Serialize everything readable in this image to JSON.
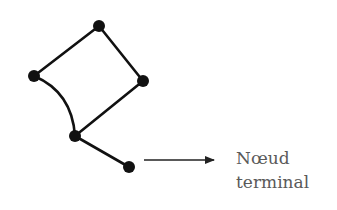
{
  "diagram": {
    "type": "graph",
    "nodes": [
      {
        "id": "top",
        "x": 99,
        "y": 26
      },
      {
        "id": "left",
        "x": 34,
        "y": 76
      },
      {
        "id": "right",
        "x": 143,
        "y": 81
      },
      {
        "id": "middle",
        "x": 75,
        "y": 136
      },
      {
        "id": "terminal",
        "x": 129,
        "y": 167
      }
    ],
    "edges": [
      {
        "from": "left",
        "to": "top",
        "style": "straight"
      },
      {
        "from": "top",
        "to": "right",
        "style": "straight"
      },
      {
        "from": "right",
        "to": "middle",
        "style": "straight"
      },
      {
        "from": "left",
        "to": "middle",
        "style": "curved"
      },
      {
        "from": "middle",
        "to": "terminal",
        "style": "straight"
      }
    ],
    "annotation": {
      "line1": "Nœud",
      "line2": "terminal",
      "points_to": "terminal"
    },
    "colors": {
      "node": "#111111",
      "edge": "#111111",
      "text": "#5a5a5a"
    }
  }
}
